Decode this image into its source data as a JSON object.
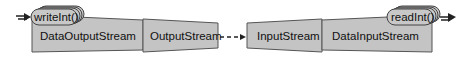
{
  "diagram": {
    "nodes": [
      {
        "id": "writeInt",
        "label": "writeInt()",
        "kind": "method"
      },
      {
        "id": "dos",
        "label": "DataOutputStream",
        "kind": "stream"
      },
      {
        "id": "os",
        "label": "OutputStream",
        "kind": "stream"
      },
      {
        "id": "is",
        "label": "InputStream",
        "kind": "stream"
      },
      {
        "id": "dis",
        "label": "DataInputStream",
        "kind": "stream"
      },
      {
        "id": "readInt",
        "label": "readInt()",
        "kind": "method"
      }
    ],
    "edges": [
      {
        "from": "os",
        "to": "is",
        "style": "dashed"
      }
    ],
    "colors": {
      "shape_fill": "#c4c4c4",
      "outline": "#555555",
      "arrow": "#222222"
    }
  }
}
